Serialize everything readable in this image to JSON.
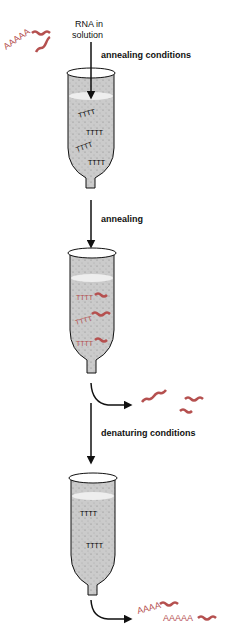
{
  "labels": {
    "rna_in_solution_1": "RNA in",
    "rna_in_solution_2": "solution",
    "annealing_conditions": "annealing conditions",
    "annealing": "annealing",
    "denaturing_conditions": "denaturing conditions"
  },
  "glyphs": {
    "poly_a_input": "AAAAA",
    "poly_a_out_1": "AAAA",
    "poly_a_out_2": "AAAAA",
    "oligo_dt": "TTTT"
  },
  "colors": {
    "rna": "#b5504f",
    "column_fill": "#c9c9c9",
    "outline": "#111111"
  }
}
